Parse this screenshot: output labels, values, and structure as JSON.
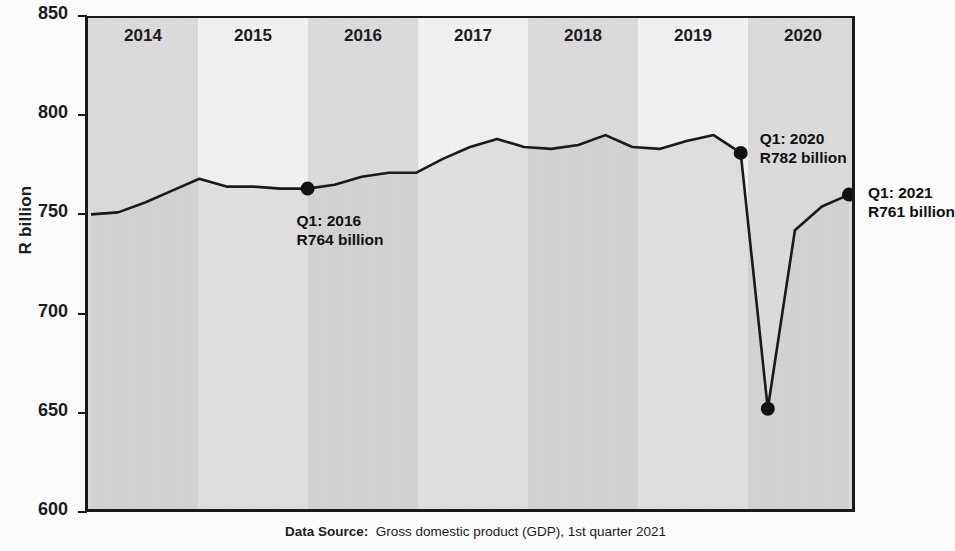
{
  "axis": {
    "y_title": "R billion",
    "y_ticks": [
      850,
      800,
      750,
      700,
      650,
      600
    ],
    "y_min": 600,
    "y_max": 850
  },
  "year_bands": [
    {
      "label": "2014",
      "shade": "dark"
    },
    {
      "label": "2015",
      "shade": "light"
    },
    {
      "label": "2016",
      "shade": "dark"
    },
    {
      "label": "2017",
      "shade": "light"
    },
    {
      "label": "2018",
      "shade": "dark"
    },
    {
      "label": "2019",
      "shade": "light"
    },
    {
      "label": "2020",
      "shade": "dark"
    }
  ],
  "annotations": [
    {
      "name": "q1-2016",
      "line1": "Q1: 2016",
      "line2": "R764 billion"
    },
    {
      "name": "q1-2020",
      "line1": "Q1: 2020",
      "line2": "R782 billion"
    },
    {
      "name": "q1-2021",
      "line1": "Q1: 2021",
      "line2": "R761 billion"
    }
  ],
  "footer": {
    "label": "Data Source",
    "separator": ":",
    "text": "Gross domestic product (GDP), 1st quarter 2021"
  },
  "colors": {
    "line": "#1a1a1a",
    "band_dark": "#dcdcdc",
    "band_light": "#f2f2f2",
    "area_fill": "#c9c9c9",
    "marker": "#111111"
  },
  "chart_data": {
    "type": "line",
    "title": "",
    "xlabel": "",
    "ylabel": "R billion",
    "ylim": [
      600,
      850
    ],
    "grid": false,
    "legend": null,
    "x": [
      "2014Q1",
      "2014Q2",
      "2014Q3",
      "2014Q4",
      "2015Q1",
      "2015Q2",
      "2015Q3",
      "2015Q4",
      "2016Q1",
      "2016Q2",
      "2016Q3",
      "2016Q4",
      "2017Q1",
      "2017Q2",
      "2017Q3",
      "2017Q4",
      "2018Q1",
      "2018Q2",
      "2018Q3",
      "2018Q4",
      "2019Q1",
      "2019Q2",
      "2019Q3",
      "2019Q4",
      "2020Q1",
      "2020Q2",
      "2020Q3",
      "2020Q4",
      "2021Q1"
    ],
    "series": [
      {
        "name": "GDP (R billion, seasonally adjusted annualised)",
        "values": [
          751,
          752,
          757,
          763,
          769,
          765,
          765,
          764,
          764,
          766,
          770,
          772,
          772,
          779,
          785,
          789,
          785,
          784,
          786,
          791,
          785,
          784,
          788,
          791,
          782,
          653,
          743,
          755,
          761
        ]
      }
    ],
    "highlighted_points": [
      {
        "x": "2016Q1",
        "y": 764,
        "label": "Q1: 2016 R764 billion"
      },
      {
        "x": "2020Q1",
        "y": 782,
        "label": "Q1: 2020 R782 billion"
      },
      {
        "x": "2020Q2",
        "y": 653,
        "label": ""
      },
      {
        "x": "2021Q1",
        "y": 761,
        "label": "Q1: 2021 R761 billion"
      }
    ],
    "year_bands": [
      "2014",
      "2015",
      "2016",
      "2017",
      "2018",
      "2019",
      "2020"
    ],
    "source": "Gross domestic product (GDP), 1st quarter 2021"
  }
}
